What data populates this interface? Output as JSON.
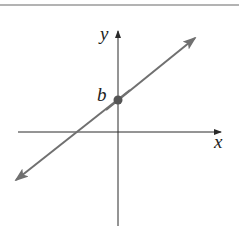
{
  "diagram": {
    "type": "coordinate-plane-line",
    "axes": {
      "x_label": "x",
      "y_label": "y"
    },
    "line": {
      "description": "line with positive slope crossing y-axis at intercept b",
      "slope_sign": "positive"
    },
    "intercept": {
      "label": "b",
      "axis": "y"
    },
    "colors": {
      "axis": "#2a2a2a",
      "line": "#707070",
      "point": "#555555",
      "rule": "#9a9a9a"
    }
  }
}
